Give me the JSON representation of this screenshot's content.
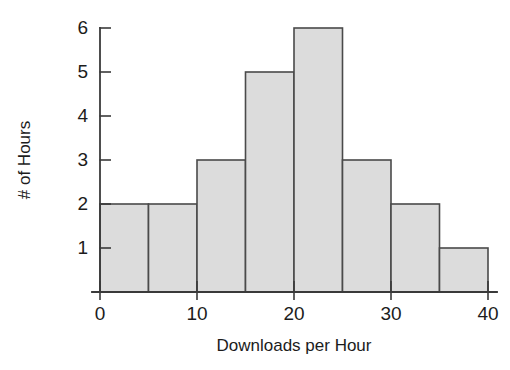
{
  "chart_data": {
    "type": "bar",
    "title": "",
    "subtitle": "",
    "xlabel": "Downloads per Hour",
    "ylabel": "# of Hours",
    "bin_width": 5,
    "bin_edges": [
      0,
      5,
      10,
      15,
      20,
      25,
      30,
      35,
      40
    ],
    "categories": [
      "0-5",
      "5-10",
      "10-15",
      "15-20",
      "20-25",
      "25-30",
      "30-35",
      "35-40"
    ],
    "values": [
      2,
      2,
      3,
      5,
      6,
      3,
      2,
      1
    ],
    "bin_centers": [
      2.5,
      7.5,
      12.5,
      17.5,
      22.5,
      27.5,
      32.5,
      37.5
    ],
    "xlim": [
      0,
      40
    ],
    "ylim": [
      0,
      6
    ],
    "x_ticks": [
      0,
      10,
      20,
      30,
      40
    ],
    "x_tick_labels": [
      "0",
      "10",
      "20",
      "30",
      "40"
    ],
    "y_ticks": [
      1,
      2,
      3,
      4,
      5,
      6
    ],
    "y_tick_labels": [
      "1",
      "2",
      "3",
      "4",
      "5",
      "6"
    ],
    "grid": false,
    "legend": false,
    "legend_position": "none",
    "total_observations": 24,
    "colors": {
      "bar_fill": "#dcdcdc",
      "bar_stroke": "#4a4a4a",
      "axis": "#3a3a3a",
      "text": "#1c1c1c",
      "background": "#ffffff"
    }
  },
  "figure": {
    "width": 510,
    "height": 370,
    "plot_left_px": 100,
    "plot_right_px": 488,
    "plot_bottom_px": 292,
    "plot_top_px": 28
  }
}
